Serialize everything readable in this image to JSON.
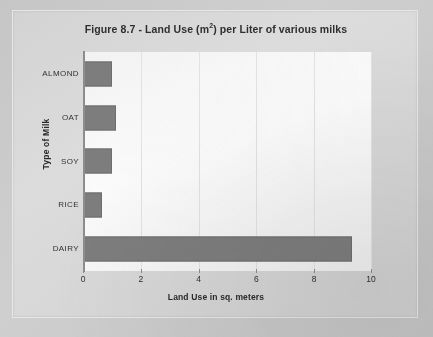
{
  "chart_data": {
    "type": "bar",
    "orientation": "horizontal",
    "title_prefix": "Figure 8.7 - Land Use (m",
    "title_superscript": "2",
    "title_suffix": ") per Liter of various milks",
    "categories": [
      "ALMOND",
      "OAT",
      "SOY",
      "RICE",
      "DAIRY"
    ],
    "values": [
      1.0,
      1.15,
      1.0,
      0.65,
      9.3
    ],
    "xlabel": "Land Use in sq. meters",
    "ylabel": "Type of Milk",
    "xlim": [
      0,
      10
    ],
    "xticks": [
      0,
      2,
      4,
      6,
      8,
      10
    ],
    "xtick_labels": [
      "0",
      "2",
      "4",
      "6",
      "8",
      "10"
    ],
    "grid": "vertical",
    "legend": "none",
    "bar_color": "#7d7d7d",
    "plot_background": "#f7f7f7",
    "figure_background": "#d6d6d6"
  }
}
